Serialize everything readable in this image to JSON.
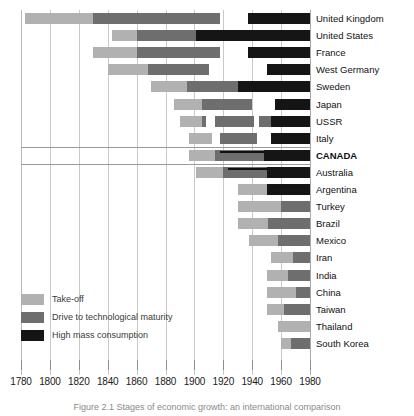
{
  "chart_data": {
    "type": "bar",
    "subtype": "stacked-horizontal-timeline",
    "title": "",
    "xlabel": "",
    "ylabel": "",
    "xlim": [
      1780,
      1980
    ],
    "tick_step": 20,
    "grid": true,
    "legend_position": "bottom-left",
    "x_ticks": [
      1780,
      1800,
      1820,
      1840,
      1860,
      1880,
      1900,
      1920,
      1940,
      1960,
      1980
    ],
    "x_tick_labels": [
      "1780",
      "1800",
      "1820",
      "1840",
      "1860",
      "1880",
      "1900",
      "1920",
      "1940",
      "1960",
      "1980"
    ],
    "legend": [
      {
        "label": "Take-off",
        "key": "takeoff",
        "color": "#b1b1b1"
      },
      {
        "label": "Drive to technological maturity",
        "key": "drive",
        "color": "#6e6e6e"
      },
      {
        "label": "High mass consumption",
        "key": "mass",
        "color": "#151515"
      }
    ],
    "categories": [
      "United Kingdom",
      "United States",
      "France",
      "West Germany",
      "Sweden",
      "Japan",
      "USSR",
      "Italy",
      "CANADA",
      "Australia",
      "Argentina",
      "Turkey",
      "Brazil",
      "Mexico",
      "Iran",
      "India",
      "China",
      "Taiwan",
      "Thailand",
      "South Korea"
    ],
    "highlighted_category": "CANADA",
    "rows": [
      {
        "name": "United Kingdom",
        "highlight": false,
        "segments": [
          {
            "stage": "takeoff",
            "start": 1783,
            "end": 1830
          },
          {
            "stage": "drive",
            "start": 1830,
            "end": 1918
          },
          {
            "stage": "mass",
            "start": 1937,
            "end": 1980
          }
        ],
        "overline": null
      },
      {
        "name": "United States",
        "highlight": false,
        "segments": [
          {
            "stage": "takeoff",
            "start": 1843,
            "end": 1860
          },
          {
            "stage": "drive",
            "start": 1860,
            "end": 1901
          },
          {
            "stage": "mass",
            "start": 1901,
            "end": 1980
          }
        ],
        "overline": null
      },
      {
        "name": "France",
        "highlight": false,
        "segments": [
          {
            "stage": "takeoff",
            "start": 1830,
            "end": 1860
          },
          {
            "stage": "drive",
            "start": 1860,
            "end": 1918
          },
          {
            "stage": "mass",
            "start": 1937,
            "end": 1980
          }
        ],
        "overline": null
      },
      {
        "name": "West Germany",
        "highlight": false,
        "segments": [
          {
            "stage": "takeoff",
            "start": 1840,
            "end": 1868
          },
          {
            "stage": "drive",
            "start": 1868,
            "end": 1910
          },
          {
            "stage": "mass",
            "start": 1950,
            "end": 1980
          }
        ],
        "overline": null
      },
      {
        "name": "Sweden",
        "highlight": false,
        "segments": [
          {
            "stage": "takeoff",
            "start": 1870,
            "end": 1895
          },
          {
            "stage": "drive",
            "start": 1895,
            "end": 1930
          },
          {
            "stage": "mass",
            "start": 1930,
            "end": 1980
          }
        ],
        "overline": null
      },
      {
        "name": "Japan",
        "highlight": false,
        "segments": [
          {
            "stage": "takeoff",
            "start": 1886,
            "end": 1905
          },
          {
            "stage": "drive",
            "start": 1905,
            "end": 1940
          },
          {
            "stage": "mass",
            "start": 1956,
            "end": 1980
          }
        ],
        "overline": null
      },
      {
        "name": "USSR",
        "highlight": false,
        "segments": [
          {
            "stage": "takeoff",
            "start": 1890,
            "end": 1905
          },
          {
            "stage": "drive",
            "start": 1905,
            "end": 1908
          },
          {
            "stage": "drive",
            "start": 1914,
            "end": 1941
          },
          {
            "stage": "drive",
            "start": 1945,
            "end": 1953
          },
          {
            "stage": "mass",
            "start": 1953,
            "end": 1980
          }
        ],
        "overline": null
      },
      {
        "name": "Italy",
        "highlight": false,
        "segments": [
          {
            "stage": "takeoff",
            "start": 1896,
            "end": 1912
          },
          {
            "stage": "drive",
            "start": 1918,
            "end": 1943
          },
          {
            "stage": "mass",
            "start": 1953,
            "end": 1980
          }
        ],
        "overline": null
      },
      {
        "name": "CANADA",
        "highlight": true,
        "segments": [
          {
            "stage": "takeoff",
            "start": 1896,
            "end": 1914
          },
          {
            "stage": "drive",
            "start": 1914,
            "end": 1948
          },
          {
            "stage": "mass",
            "start": 1948,
            "end": 1980
          }
        ],
        "overline": {
          "start": 1918,
          "end": 1948
        }
      },
      {
        "name": "Australia",
        "highlight": false,
        "segments": [
          {
            "stage": "takeoff",
            "start": 1901,
            "end": 1920
          },
          {
            "stage": "drive",
            "start": 1920,
            "end": 1950
          },
          {
            "stage": "mass",
            "start": 1950,
            "end": 1980
          }
        ],
        "overline": {
          "start": 1923,
          "end": 1950
        }
      },
      {
        "name": "Argentina",
        "highlight": false,
        "segments": [
          {
            "stage": "takeoff",
            "start": 1930,
            "end": 1950
          },
          {
            "stage": "mass",
            "start": 1950,
            "end": 1980
          }
        ],
        "overline": {
          "start": 1952,
          "end": 1978
        }
      },
      {
        "name": "Turkey",
        "highlight": false,
        "segments": [
          {
            "stage": "takeoff",
            "start": 1930,
            "end": 1960
          },
          {
            "stage": "drive",
            "start": 1960,
            "end": 1980
          }
        ],
        "overline": null
      },
      {
        "name": "Brazil",
        "highlight": false,
        "segments": [
          {
            "stage": "takeoff",
            "start": 1930,
            "end": 1951
          },
          {
            "stage": "drive",
            "start": 1951,
            "end": 1980
          }
        ],
        "overline": null
      },
      {
        "name": "Mexico",
        "highlight": false,
        "segments": [
          {
            "stage": "takeoff",
            "start": 1938,
            "end": 1958
          },
          {
            "stage": "drive",
            "start": 1958,
            "end": 1980
          }
        ],
        "overline": null
      },
      {
        "name": "Iran",
        "highlight": false,
        "segments": [
          {
            "stage": "takeoff",
            "start": 1953,
            "end": 1968
          },
          {
            "stage": "drive",
            "start": 1968,
            "end": 1980
          }
        ],
        "overline": null
      },
      {
        "name": "India",
        "highlight": false,
        "segments": [
          {
            "stage": "takeoff",
            "start": 1950,
            "end": 1965
          },
          {
            "stage": "drive",
            "start": 1965,
            "end": 1980
          }
        ],
        "overline": null
      },
      {
        "name": "China",
        "highlight": false,
        "segments": [
          {
            "stage": "takeoff",
            "start": 1950,
            "end": 1970
          },
          {
            "stage": "drive",
            "start": 1970,
            "end": 1980
          }
        ],
        "overline": null
      },
      {
        "name": "Taiwan",
        "highlight": false,
        "segments": [
          {
            "stage": "takeoff",
            "start": 1950,
            "end": 1962
          },
          {
            "stage": "drive",
            "start": 1962,
            "end": 1980
          }
        ],
        "overline": null
      },
      {
        "name": "Thailand",
        "highlight": false,
        "segments": [
          {
            "stage": "takeoff",
            "start": 1958,
            "end": 1980
          }
        ],
        "overline": null
      },
      {
        "name": "South Korea",
        "highlight": false,
        "segments": [
          {
            "stage": "takeoff",
            "start": 1960,
            "end": 1967
          },
          {
            "stage": "drive",
            "start": 1967,
            "end": 1980
          }
        ],
        "overline": null
      }
    ]
  },
  "caption": {
    "text": "Figure 2.1  Stages of economic growth: an international comparison"
  },
  "colors": {
    "takeoff": "#b1b1b1",
    "drive": "#6e6e6e",
    "mass": "#151515",
    "grid": "#c9c9c9",
    "axis_text": "#1a1a1a"
  }
}
